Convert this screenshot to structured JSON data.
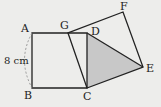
{
  "diagram": {
    "labels": {
      "A": "A",
      "B": "B",
      "C": "C",
      "D": "D",
      "E": "E",
      "F": "F",
      "G": "G",
      "side_length": "8 cm"
    },
    "colors": {
      "background": "#ededeb",
      "line": "#222222",
      "shaded": "#c8c8c8",
      "dashed_arc": "#999999"
    },
    "shapes": [
      {
        "name": "square-ABCD",
        "vertices": [
          "A",
          "B",
          "C",
          "D"
        ]
      },
      {
        "name": "square-GCEF",
        "vertices": [
          "G",
          "C",
          "E",
          "F"
        ]
      },
      {
        "name": "triangle-DCE",
        "vertices": [
          "D",
          "C",
          "E"
        ],
        "shaded": true
      }
    ]
  }
}
